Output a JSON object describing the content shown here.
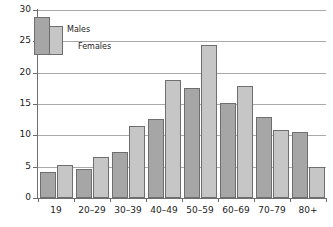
{
  "chart_data": {
    "type": "bar",
    "title": "",
    "xlabel": "",
    "ylabel": "",
    "categories": [
      "19",
      "20–29",
      "30–39",
      "40–49",
      "50–59",
      "60–69",
      "70–79",
      "80+"
    ],
    "series": [
      {
        "name": "Males",
        "color": "#a6a6a6",
        "values": [
          4.1,
          4.6,
          7.3,
          12.6,
          17.6,
          15.2,
          13.0,
          10.5
        ]
      },
      {
        "name": "Females",
        "color": "#c6c6c6",
        "values": [
          5.3,
          6.6,
          11.5,
          18.8,
          24.4,
          17.9,
          10.9,
          4.9
        ]
      }
    ],
    "ylim": [
      0,
      30
    ],
    "yticks": [
      0,
      5,
      10,
      15,
      20,
      25,
      30
    ],
    "ytick_labels": [
      "0",
      "5",
      "10",
      "15",
      "20",
      "25",
      "30"
    ],
    "grid": true,
    "grid_axis": "y",
    "legend_position": "top-left",
    "legend_entries": [
      "Males",
      "Females"
    ]
  },
  "axes": {
    "y_axis_name": "value-axis",
    "x_axis_name": "age-group-axis"
  }
}
